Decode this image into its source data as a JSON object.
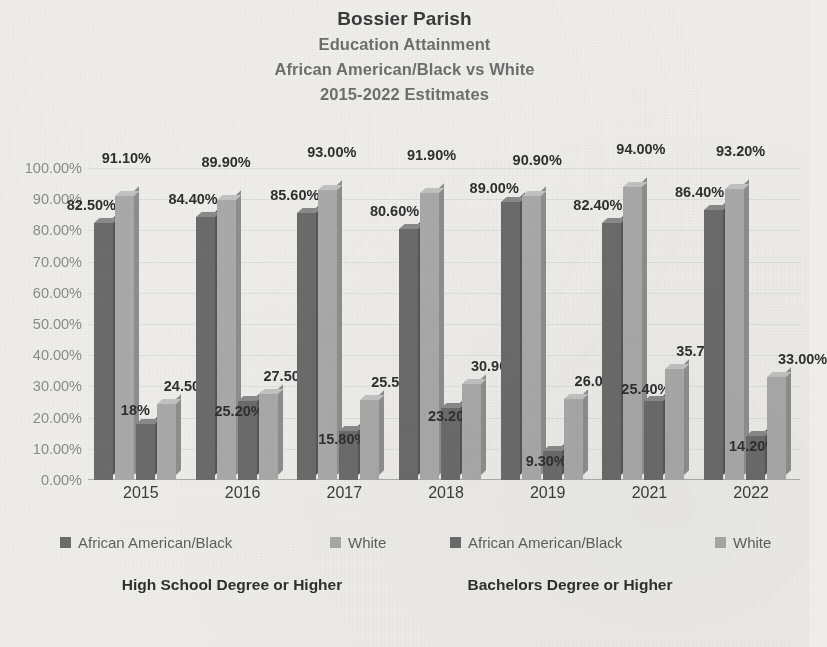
{
  "title": {
    "main": "Bossier Parish",
    "sub1": "Education Attainment",
    "sub2": "African American/Black vs White",
    "sub3": "2015-2022 Estitmates"
  },
  "legend": [
    {
      "label": "African American/Black",
      "swatch": "dark"
    },
    {
      "label": "White",
      "swatch": "light"
    },
    {
      "label": "African American/Black",
      "swatch": "dark"
    },
    {
      "label": "White",
      "swatch": "light"
    }
  ],
  "group_captions": [
    "High School Degree or Higher",
    "Bachelors Degree or Higher"
  ],
  "colors": {
    "dark": "#6b6b6b",
    "light": "#a9a9a9",
    "background": "#eeedea",
    "title": "#3a3a3a",
    "subtitle": "#6e6e6e",
    "axis_text": "#8a8a8a"
  },
  "chart_data": {
    "type": "bar",
    "title": "Bossier Parish Education Attainment African American/Black vs White 2015-2022 Estitmates",
    "xlabel": "",
    "ylabel": "",
    "ylim": [
      0,
      100
    ],
    "grid": true,
    "legend_position": "bottom",
    "categories": [
      "2015",
      "2016",
      "2017",
      "2018",
      "2019",
      "2021",
      "2022"
    ],
    "ytick_labels": [
      "100.00%",
      "90.00%",
      "80.00%",
      "70.00%",
      "60.00%",
      "50.00%",
      "40.00%",
      "30.00%",
      "20.00%",
      "10.00%",
      "0.00%"
    ],
    "ytick_values": [
      100,
      90,
      80,
      70,
      60,
      50,
      40,
      30,
      20,
      10,
      0
    ],
    "series": [
      {
        "name": "African American/Black",
        "group": "High School Degree or Higher",
        "swatch": "dark",
        "values": [
          82.5,
          84.4,
          85.6,
          80.6,
          89.0,
          82.4,
          86.4
        ],
        "labels": [
          "82.50%",
          "84.40%",
          "85.60%",
          "80.60%",
          "89.00%",
          "82.40%",
          "86.40%"
        ]
      },
      {
        "name": "White",
        "group": "High School Degree or Higher",
        "swatch": "light",
        "values": [
          91.1,
          89.9,
          93.0,
          91.9,
          90.9,
          94.0,
          93.2
        ],
        "labels": [
          "91.10%",
          "89.90%",
          "93.00%",
          "91.90%",
          "90.90%",
          "94.00%",
          "93.20%"
        ]
      },
      {
        "name": "African American/Black",
        "group": "Bachelors Degree or Higher",
        "swatch": "dark",
        "values": [
          18.0,
          25.2,
          15.8,
          23.2,
          9.3,
          25.4,
          14.2
        ],
        "labels": [
          "18%",
          "25.20%",
          "15.80%",
          "23.20%",
          "9.30%",
          "25.40%",
          "14.20%"
        ]
      },
      {
        "name": "White",
        "group": "Bachelors Degree or Higher",
        "swatch": "light",
        "values": [
          24.5,
          27.5,
          25.5,
          30.9,
          26.0,
          35.7,
          33.0
        ],
        "labels": [
          "24.50%",
          "27.50%",
          "25.50%",
          "30.90%",
          "26.00%",
          "35.70%",
          "33.00%"
        ]
      }
    ],
    "label_offsets": [
      [
        {
          "dx": -12,
          "dy": -2
        },
        {
          "dx": 2,
          "dy": -22
        },
        {
          "dx": -10,
          "dy": 2
        },
        {
          "dx": 22,
          "dy": -2
        }
      ],
      [
        {
          "dx": -12,
          "dy": -2
        },
        {
          "dx": 0,
          "dy": -22
        },
        {
          "dx": -8,
          "dy": 26
        },
        {
          "dx": 20,
          "dy": -2
        }
      ],
      [
        {
          "dx": -12,
          "dy": -2
        },
        {
          "dx": 4,
          "dy": -22
        },
        {
          "dx": -6,
          "dy": 24
        },
        {
          "dx": 26,
          "dy": -2
        }
      ],
      [
        {
          "dx": -14,
          "dy": -2
        },
        {
          "dx": 2,
          "dy": -22
        },
        {
          "dx": 2,
          "dy": 24
        },
        {
          "dx": 24,
          "dy": -2
        }
      ],
      [
        {
          "dx": -16,
          "dy": 2
        },
        {
          "dx": 6,
          "dy": -20
        },
        {
          "dx": -6,
          "dy": 26
        },
        {
          "dx": 26,
          "dy": -2
        }
      ],
      [
        {
          "dx": -14,
          "dy": -2
        },
        {
          "dx": 8,
          "dy": -22
        },
        {
          "dx": -8,
          "dy": 4
        },
        {
          "dx": 26,
          "dy": -2
        }
      ],
      [
        {
          "dx": -14,
          "dy": -2
        },
        {
          "dx": 6,
          "dy": -22
        },
        {
          "dx": -2,
          "dy": 26
        },
        {
          "dx": 26,
          "dy": -2
        }
      ]
    ]
  }
}
